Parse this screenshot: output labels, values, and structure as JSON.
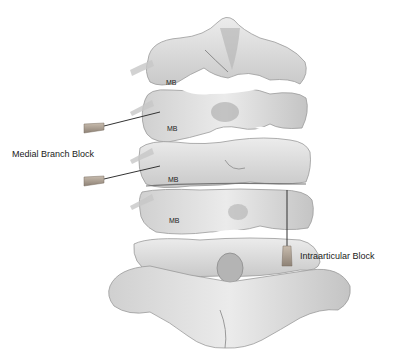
{
  "figure": {
    "labels": {
      "medial_branch_block": "Medial Branch Block",
      "intraarticular_block": "Intraarticular Block"
    },
    "mb_markers": [
      {
        "text": "MB",
        "x": 166,
        "y": 79
      },
      {
        "text": "MB",
        "x": 167,
        "y": 125
      },
      {
        "text": "MB",
        "x": 168,
        "y": 176
      },
      {
        "text": "MB",
        "x": 169,
        "y": 218
      }
    ],
    "needles": [
      {
        "type": "medial-branch",
        "tip_x": 160,
        "tip_y": 112,
        "hub_x": 84,
        "hub_y": 128
      },
      {
        "type": "medial-branch",
        "tip_x": 160,
        "tip_y": 166,
        "hub_x": 84,
        "hub_y": 181
      },
      {
        "type": "intraarticular",
        "tip_x": 287,
        "tip_y": 190,
        "hub_x": 287,
        "hub_y": 265
      }
    ],
    "colors": {
      "bone_light": "#e6e6e6",
      "bone_mid": "#cfcfcf",
      "bone_dark": "#9a9a9a",
      "needle_hub": "#a89a8a",
      "needle_shaft": "#333333",
      "text": "#1a1a1a"
    }
  }
}
